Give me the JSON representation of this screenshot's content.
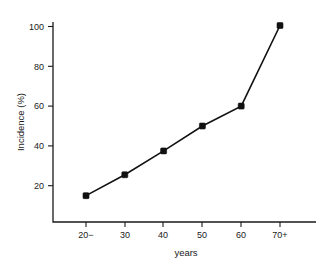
{
  "chart_data": {
    "type": "line",
    "title": "",
    "xlabel": "years",
    "ylabel": "Incidence (%)",
    "categories": [
      "20−",
      "30",
      "40",
      "50",
      "60",
      "70+"
    ],
    "values": [
      15,
      25.5,
      37.5,
      50,
      60,
      100.5
    ],
    "series": [
      {
        "name": "Incidence",
        "values": [
          15,
          25.5,
          37.5,
          50,
          60,
          100.5
        ],
        "color": "#111111",
        "marker": "filled-square",
        "line_style": "solid"
      }
    ],
    "ylim": [
      0,
      108
    ],
    "yticks": [
      20,
      40,
      60,
      80,
      100
    ],
    "ytick_labels": [
      "20",
      "40",
      "60",
      "80",
      "100"
    ],
    "xtick_labels": [
      "20−",
      "30",
      "40",
      "50",
      "60",
      "70+"
    ],
    "grid": false,
    "legend": false,
    "legend_position": "none",
    "background_color": "#ffffff",
    "axis_color": "#1a1a1a",
    "spines": [
      "left",
      "bottom"
    ]
  }
}
